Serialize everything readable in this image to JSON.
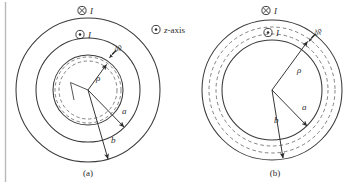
{
  "figure": {
    "title_visible": false,
    "background_color": "#ffffff",
    "stroke_color": "#3a3a3a",
    "dash_color": "#6b6b6b",
    "text_color": "#2b2b2b",
    "page_edge_line": "vertical-rule-left"
  },
  "legend": {
    "z_axis_symbol": "dot-in-circle",
    "z_axis_label": "z-axis"
  },
  "panel_a": {
    "caption": "(a)",
    "current_out_symbol": "dot-in-circle",
    "current_in_symbol": "cross-in-circle",
    "current_label": "I",
    "labels": {
      "rho": "ρ",
      "d_rho": "dρ",
      "a": "a",
      "b": "b"
    },
    "geometry": {
      "center_x": 88,
      "center_y": 90,
      "outer_radius_b": 72,
      "middle_radius_a": 52,
      "inner_radius": 35,
      "dashed_inner_radius": 29,
      "dashed_outer_radius": 33
    }
  },
  "panel_b": {
    "caption": "(b)",
    "current_out_symbol": "dot-in-circle",
    "current_in_symbol": "cross-in-circle",
    "current_label": "I",
    "labels": {
      "rho": "ρ",
      "d_rho": "dρ",
      "a": "a",
      "b": "b"
    },
    "geometry": {
      "center_x": 272,
      "center_y": 90,
      "outer_radius_b": 70,
      "inner_radius_a": 50,
      "dashed_inner_radius": 56,
      "dashed_outer_radius": 63
    }
  }
}
